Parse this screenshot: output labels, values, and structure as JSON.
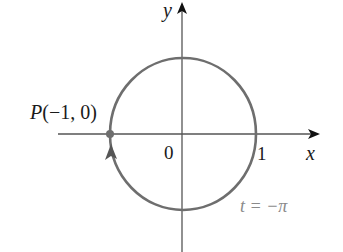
{
  "diagram": {
    "type": "parametric-curve",
    "axes": {
      "x_label": "x",
      "y_label": "y",
      "origin_label": "0",
      "x_tick_label": "1"
    },
    "point": {
      "label": "P(−1, 0)",
      "x": -1,
      "y": 0
    },
    "parameter_label": "t = −π",
    "colors": {
      "curve": "#6e6e6e",
      "axis": "#555555",
      "arrow": "#111111",
      "point": "#6e6e6e",
      "text": "#1a1a1a",
      "param_text": "#8a8a8a"
    }
  }
}
